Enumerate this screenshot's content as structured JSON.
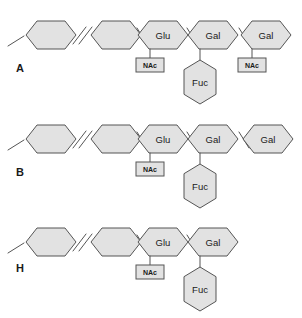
{
  "figure": {
    "background_color": "#ffffff",
    "shape_fill_color": "#e2e2e2",
    "shape_stroke_color": "#555555",
    "text_color": "#1a1a1a"
  },
  "rows": [
    {
      "label": "A",
      "label_x": 16,
      "label_y": 72,
      "baseline_y": 35,
      "stub": {
        "x1": 8,
        "y1": 46,
        "x2": 24,
        "y2": 36
      },
      "break_mark": {
        "slash1": {
          "x1": 73,
          "y1": 44,
          "x2": 86,
          "y2": 27
        },
        "slash2": {
          "x1": 79,
          "y1": 44,
          "x2": 92,
          "y2": 27
        }
      },
      "units": [
        {
          "name": "hex-plain-1",
          "label": "",
          "cx": 51,
          "cy": 35,
          "w": 50,
          "h": 28
        },
        {
          "name": "hex-plain-2",
          "label": "",
          "cx": 116,
          "cy": 35,
          "w": 50,
          "h": 28
        },
        {
          "name": "hex-glu",
          "label": "Glu",
          "cx": 163,
          "cy": 35,
          "w": 50,
          "h": 28,
          "nac": {
            "label": "NAc",
            "x": 136,
            "y": 58,
            "w": 28,
            "h": 14,
            "stem_x": 150,
            "stem_y1": 49,
            "stem_y2": 58
          }
        },
        {
          "name": "hex-gal-1",
          "label": "Gal",
          "cx": 213,
          "cy": 35,
          "w": 50,
          "h": 28,
          "fuc": {
            "label": "Fuc",
            "cx": 200,
            "cy": 82,
            "w": 32,
            "h": 44,
            "stem_x": 200,
            "stem_y1": 49,
            "stem_y2": 60
          }
        },
        {
          "name": "hex-gal-2",
          "label": "Gal",
          "cx": 266,
          "cy": 35,
          "w": 50,
          "h": 28,
          "nac": {
            "label": "NAc",
            "x": 238,
            "y": 58,
            "w": 28,
            "h": 14,
            "stem_x": 252,
            "stem_y1": 49,
            "stem_y2": 58
          }
        }
      ],
      "connectors": [
        {
          "x1": 137,
          "y1": 28,
          "x2": 147,
          "y2": 44
        },
        {
          "x1": 187,
          "y1": 28,
          "x2": 197,
          "y2": 44
        },
        {
          "x1": 239,
          "y1": 28,
          "x2": 249,
          "y2": 44
        }
      ]
    },
    {
      "label": "B",
      "label_x": 16,
      "label_y": 176,
      "baseline_y": 139,
      "stub": {
        "x1": 8,
        "y1": 150,
        "x2": 24,
        "y2": 140
      },
      "break_mark": {
        "slash1": {
          "x1": 73,
          "y1": 148,
          "x2": 86,
          "y2": 131
        },
        "slash2": {
          "x1": 79,
          "y1": 148,
          "x2": 92,
          "y2": 131
        }
      },
      "units": [
        {
          "name": "hex-plain-1",
          "label": "",
          "cx": 51,
          "cy": 139,
          "w": 50,
          "h": 28
        },
        {
          "name": "hex-plain-2",
          "label": "",
          "cx": 116,
          "cy": 139,
          "w": 50,
          "h": 28
        },
        {
          "name": "hex-glu",
          "label": "Glu",
          "cx": 163,
          "cy": 139,
          "w": 50,
          "h": 28,
          "nac": {
            "label": "NAc",
            "x": 136,
            "y": 162,
            "w": 28,
            "h": 14,
            "stem_x": 150,
            "stem_y1": 153,
            "stem_y2": 162
          }
        },
        {
          "name": "hex-gal-1",
          "label": "Gal",
          "cx": 213,
          "cy": 139,
          "w": 50,
          "h": 28,
          "fuc": {
            "label": "Fuc",
            "cx": 200,
            "cy": 186,
            "w": 32,
            "h": 44,
            "stem_x": 200,
            "stem_y1": 153,
            "stem_y2": 164
          }
        },
        {
          "name": "hex-gal-2",
          "label": "Gal",
          "cx": 268,
          "cy": 139,
          "w": 50,
          "h": 28
        }
      ],
      "connectors": [
        {
          "x1": 137,
          "y1": 132,
          "x2": 147,
          "y2": 148
        },
        {
          "x1": 187,
          "y1": 132,
          "x2": 197,
          "y2": 148
        },
        {
          "x1": 239,
          "y1": 132,
          "x2": 249,
          "y2": 148
        }
      ]
    },
    {
      "label": "H",
      "label_x": 16,
      "label_y": 272,
      "baseline_y": 242,
      "stub": {
        "x1": 8,
        "y1": 253,
        "x2": 24,
        "y2": 243
      },
      "break_mark": {
        "slash1": {
          "x1": 73,
          "y1": 251,
          "x2": 86,
          "y2": 234
        },
        "slash2": {
          "x1": 79,
          "y1": 251,
          "x2": 92,
          "y2": 234
        }
      },
      "units": [
        {
          "name": "hex-plain-1",
          "label": "",
          "cx": 51,
          "cy": 242,
          "w": 50,
          "h": 28
        },
        {
          "name": "hex-plain-2",
          "label": "",
          "cx": 116,
          "cy": 242,
          "w": 50,
          "h": 28
        },
        {
          "name": "hex-glu",
          "label": "Glu",
          "cx": 163,
          "cy": 242,
          "w": 50,
          "h": 28,
          "nac": {
            "label": "NAc",
            "x": 136,
            "y": 265,
            "w": 28,
            "h": 14,
            "stem_x": 150,
            "stem_y1": 256,
            "stem_y2": 265
          }
        },
        {
          "name": "hex-gal-1",
          "label": "Gal",
          "cx": 213,
          "cy": 242,
          "w": 50,
          "h": 28,
          "fuc": {
            "label": "Fuc",
            "cx": 200,
            "cy": 289,
            "w": 32,
            "h": 44,
            "stem_x": 200,
            "stem_y1": 256,
            "stem_y2": 267
          }
        }
      ],
      "connectors": [
        {
          "x1": 137,
          "y1": 235,
          "x2": 147,
          "y2": 251
        },
        {
          "x1": 187,
          "y1": 235,
          "x2": 197,
          "y2": 251
        }
      ]
    }
  ]
}
